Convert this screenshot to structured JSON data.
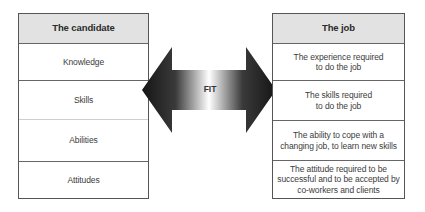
{
  "candidate": {
    "title": "The candidate",
    "rows": [
      "Knowledge",
      "Skills",
      "Abilities",
      "Attitudes"
    ]
  },
  "job": {
    "title": "The job",
    "rows": [
      "The experience required\nto do the job",
      "The skills required\nto do the job",
      "The ability to cope with a\nchanging job, to learn new skills",
      "The attitude required to be\nsuccessful and to be accepted by\nco-workers and clients"
    ]
  },
  "arrow": {
    "label": "FIT",
    "colors": {
      "dark": "#1a1a1a",
      "light": "#ffffff"
    }
  }
}
